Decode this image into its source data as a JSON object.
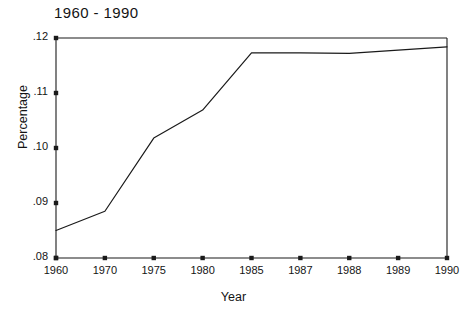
{
  "chart_data": {
    "type": "line",
    "title": "1960 - 1990",
    "xlabel": "Year",
    "ylabel": "Percentage",
    "categories": [
      "1960",
      "1970",
      "1975",
      "1980",
      "1985",
      "1987",
      "1988",
      "1989",
      "1990"
    ],
    "values": [
      0.085,
      0.0885,
      0.1018,
      0.1069,
      0.1173,
      0.1173,
      0.1172,
      0.1178,
      0.1184
    ],
    "series": [
      {
        "name": "Percentage",
        "values": [
          0.085,
          0.0885,
          0.1018,
          0.1069,
          0.1173,
          0.1173,
          0.1172,
          0.1178,
          0.1184
        ]
      }
    ],
    "ylim": [
      0.08,
      0.12
    ],
    "ytick_labels": [
      ".12",
      ".11",
      ".10",
      ".09",
      ".08"
    ],
    "ytick_values": [
      0.12,
      0.11,
      0.1,
      0.09,
      0.08
    ],
    "xtick_labels": [
      "1960",
      "1970",
      "1975",
      "1980",
      "1985",
      "1987",
      "1988",
      "1989",
      "1990"
    ],
    "grid": false,
    "legend": "none",
    "line_color": "#1a1a1a",
    "axis_color": "#1a1a1a",
    "background_color": "#ffffff"
  }
}
